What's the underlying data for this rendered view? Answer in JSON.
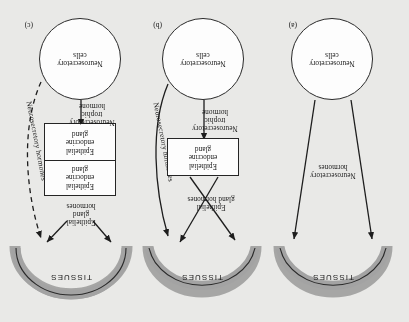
{
  "figure": {
    "type": "diagram",
    "orientation": "rotated-180",
    "background_color": "#e9e9e7",
    "arc_color": "#9a9a9a",
    "arc_shadow_color": "#6f6f6f",
    "line_color": "#1d1d1d",
    "box_fill": "#fdfdfd",
    "tissues_label": "TISSUES"
  },
  "panels": [
    {
      "tag": "(a)",
      "source_label": "Neurosecretory\ncells",
      "target_label": "TISSUES",
      "arrow_labels": [
        {
          "text": "Neurosecretory\nhormones"
        }
      ],
      "glands": []
    },
    {
      "tag": "(b)",
      "source_label": "Neurosecretory\ncells",
      "target_label": "TISSUES",
      "arrow_labels": [
        {
          "text": "Neurosecretory\ntrophic\nhormone"
        },
        {
          "text": "Epithelial\ngland hormones"
        },
        {
          "text": "Neurosecretory hormones"
        }
      ],
      "glands": [
        {
          "text": "Epithelial\nendocrine\ngland"
        }
      ]
    },
    {
      "tag": "(c)",
      "source_label": "Neurosecretory\ncells",
      "target_label": "TISSUES",
      "arrow_labels": [
        {
          "text": "Neurosecretory\ntrophic\nhormone"
        },
        {
          "text": "Epithelial gland\ntrophic hormone"
        },
        {
          "text": "Epithelial\ngland\nhormones"
        },
        {
          "text": "Neurosecretory hormones"
        }
      ],
      "glands": [
        {
          "text": "Epithelial\nendocrine\ngland"
        },
        {
          "text": "Epithelial\nendocrine\ngland"
        }
      ]
    }
  ]
}
